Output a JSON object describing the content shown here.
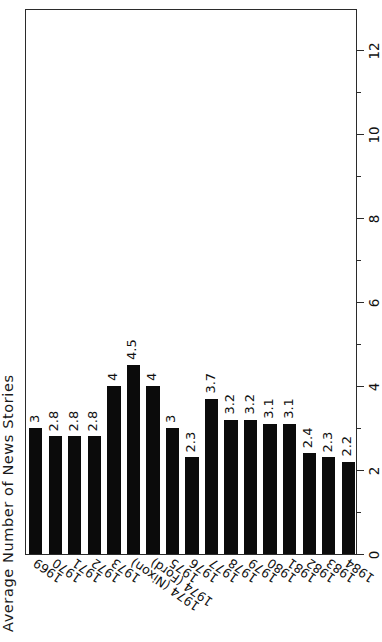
{
  "figure": {
    "axis_title": "Average Number of News Stories",
    "orientation": "rotated-90-ccw",
    "frame_color": "#2b2b2b",
    "bar_color": "#0b0b0b",
    "background": "#ffffff"
  },
  "chart_data": {
    "type": "bar",
    "title": "",
    "subtitle": "",
    "xlabel": "",
    "ylabel": "Average Number of News Stories",
    "orientation": "vertical-bars-rotated",
    "grid": false,
    "legend": null,
    "ylim": [
      0,
      13
    ],
    "yticks": [
      0,
      2,
      4,
      6,
      8,
      10,
      12
    ],
    "ytick_labels": [
      "0",
      "2",
      "4",
      "6",
      "8",
      "10",
      "12"
    ],
    "minor_ticks": true,
    "categories": [
      "1969",
      "1970",
      "1971",
      "1972",
      "1973",
      "1974 (Nixon)",
      "1974 (Ford)",
      "1975",
      "1976",
      "1977",
      "1978",
      "1979",
      "1980",
      "1981",
      "1982",
      "1983",
      "1984"
    ],
    "values": [
      3,
      2.8,
      2.8,
      2.8,
      4,
      4.5,
      4,
      3,
      2.3,
      3.7,
      3.2,
      3.2,
      3.1,
      3.1,
      2.4,
      2.3,
      2.2
    ],
    "value_labels": [
      "3",
      "2.8",
      "2.8",
      "2.8",
      "4",
      "4.5",
      "4",
      "3",
      "2.3",
      "3.7",
      "3.2",
      "3.2",
      "3.1",
      "3.1",
      "2.4",
      "2.3",
      "2.2"
    ]
  }
}
